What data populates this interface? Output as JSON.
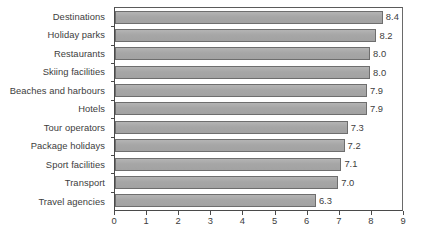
{
  "chart_data": {
    "type": "bar",
    "orientation": "horizontal",
    "title": "",
    "subtitle": "",
    "xlabel": "",
    "ylabel": "",
    "xlim": [
      0,
      9
    ],
    "xticks": [
      "0",
      "1",
      "2",
      "3",
      "4",
      "5",
      "6",
      "7",
      "8",
      "9"
    ],
    "grid": false,
    "legend": null,
    "bar_color": "#a9a9a9",
    "bar_border_color": "#6e6e6e",
    "axis_color": "#4a4a4a",
    "text_color": "#3d3d3d",
    "background": "#ffffff",
    "categories": [
      "Destinations",
      "Holiday parks",
      "Restaurants",
      "Skiing facilities",
      "Beaches and harbours",
      "Hotels",
      "Tour operators",
      "Package holidays",
      "Sport facilities",
      "Transport",
      "Travel agencies"
    ],
    "values": [
      8.4,
      8.2,
      8.0,
      8.0,
      7.9,
      7.9,
      7.3,
      7.2,
      7.1,
      7.0,
      6.3
    ],
    "value_labels": [
      "8.4",
      "8.2",
      "8.0",
      "8.0",
      "7.9",
      "7.9",
      "7.3",
      "7.2",
      "7.1",
      "7.0",
      "6.3"
    ]
  }
}
